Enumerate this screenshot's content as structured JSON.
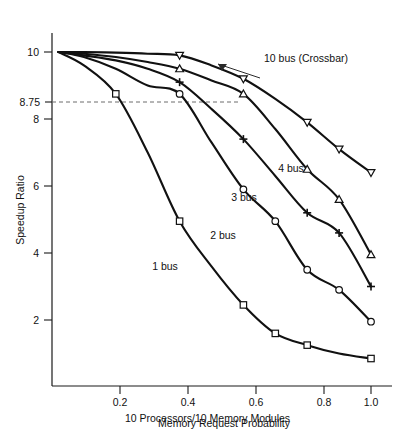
{
  "chart_data": {
    "type": "line",
    "title": "",
    "subtitle": "",
    "caption": "10 Processors/10 Memory Modules",
    "xlabel": "Memory Request Probability",
    "ylabel": "Speedup Ratio",
    "xlim": [
      0.0,
      1.08
    ],
    "ylim": [
      0.0,
      10.6
    ],
    "grid": false,
    "legend_position": "inline-annotations",
    "xticks": [
      0.2,
      0.4,
      0.6,
      0.8,
      1.0
    ],
    "xtick_labels": [
      "0.2",
      "0.4",
      "0.6",
      "0.8",
      "1.0"
    ],
    "yticks": [
      2,
      4,
      6,
      8,
      8.75,
      10
    ],
    "ytick_labels": [
      "2",
      "4",
      "6",
      "8",
      "8.75",
      "10"
    ],
    "annotations": [
      {
        "name": "crossbar-callout",
        "text": "10 bus (Crossbar)",
        "x": 0.6,
        "y": 9.95
      },
      {
        "name": "reference-line-8-75",
        "text": "8.75",
        "value": 8.75,
        "style": "dashed",
        "from_x": 0.0,
        "to_x": 0.62
      }
    ],
    "series": [
      {
        "name": "10 bus (Crossbar)",
        "label": "10 bus (Crossbar)",
        "marker": "triangle-down",
        "x": [
          0.02,
          0.1,
          0.2,
          0.3,
          0.4,
          0.5,
          0.6,
          0.7,
          0.8,
          0.9,
          1.0
        ],
        "values": [
          10.0,
          10.0,
          9.98,
          9.95,
          9.9,
          9.6,
          9.2,
          8.6,
          7.9,
          7.1,
          6.4
        ]
      },
      {
        "name": "4 bus",
        "label": "4 bus",
        "marker": "triangle-up",
        "x": [
          0.02,
          0.1,
          0.2,
          0.3,
          0.4,
          0.5,
          0.6,
          0.7,
          0.8,
          0.9,
          1.0
        ],
        "values": [
          10.0,
          9.95,
          9.85,
          9.7,
          9.5,
          9.15,
          8.75,
          7.7,
          6.5,
          5.6,
          3.95
        ]
      },
      {
        "name": "3 bus",
        "label": "3 bus",
        "marker": "plus",
        "x": [
          0.02,
          0.1,
          0.2,
          0.3,
          0.4,
          0.5,
          0.6,
          0.7,
          0.8,
          0.9,
          1.0
        ],
        "values": [
          10.0,
          9.9,
          9.75,
          9.5,
          9.1,
          8.3,
          7.4,
          6.3,
          5.2,
          4.6,
          3.0
        ]
      },
      {
        "name": "2 bus",
        "label": "2 bus",
        "marker": "circle",
        "x": [
          0.02,
          0.1,
          0.2,
          0.3,
          0.4,
          0.5,
          0.6,
          0.7,
          0.8,
          0.9,
          1.0
        ],
        "values": [
          10.0,
          9.85,
          9.5,
          9.0,
          8.75,
          7.3,
          5.9,
          4.95,
          3.5,
          2.9,
          1.95
        ]
      },
      {
        "name": "1 bus",
        "label": "1 bus",
        "marker": "square",
        "x": [
          0.02,
          0.1,
          0.2,
          0.3,
          0.4,
          0.5,
          0.6,
          0.7,
          0.8,
          0.9,
          1.0
        ],
        "values": [
          10.0,
          9.6,
          8.75,
          7.0,
          4.95,
          3.6,
          2.45,
          1.6,
          1.25,
          1.0,
          0.85
        ]
      }
    ],
    "marked_points": [
      {
        "series": "1 bus",
        "x": 0.2,
        "y": 8.75,
        "marker": "square"
      },
      {
        "series": "1 bus",
        "x": 0.4,
        "y": 4.95,
        "marker": "square"
      },
      {
        "series": "1 bus",
        "x": 0.6,
        "y": 2.45,
        "marker": "square"
      },
      {
        "series": "1 bus",
        "x": 0.7,
        "y": 1.6,
        "marker": "square"
      },
      {
        "series": "1 bus",
        "x": 0.8,
        "y": 1.25,
        "marker": "square"
      },
      {
        "series": "1 bus",
        "x": 1.0,
        "y": 0.85,
        "marker": "square"
      },
      {
        "series": "2 bus",
        "x": 0.4,
        "y": 8.75,
        "marker": "circle"
      },
      {
        "series": "2 bus",
        "x": 0.6,
        "y": 5.9,
        "marker": "circle"
      },
      {
        "series": "2 bus",
        "x": 0.7,
        "y": 4.95,
        "marker": "circle"
      },
      {
        "series": "2 bus",
        "x": 0.8,
        "y": 3.5,
        "marker": "circle"
      },
      {
        "series": "2 bus",
        "x": 0.9,
        "y": 2.9,
        "marker": "circle"
      },
      {
        "series": "2 bus",
        "x": 1.0,
        "y": 1.95,
        "marker": "circle"
      },
      {
        "series": "3 bus",
        "x": 0.4,
        "y": 9.1,
        "marker": "plus"
      },
      {
        "series": "3 bus",
        "x": 0.6,
        "y": 7.4,
        "marker": "plus"
      },
      {
        "series": "3 bus",
        "x": 0.8,
        "y": 5.2,
        "marker": "plus"
      },
      {
        "series": "3 bus",
        "x": 0.9,
        "y": 4.6,
        "marker": "plus"
      },
      {
        "series": "3 bus",
        "x": 1.0,
        "y": 3.0,
        "marker": "plus"
      },
      {
        "series": "4 bus",
        "x": 0.4,
        "y": 9.5,
        "marker": "triangle-up"
      },
      {
        "series": "4 bus",
        "x": 0.6,
        "y": 8.75,
        "marker": "triangle-up"
      },
      {
        "series": "4 bus",
        "x": 0.8,
        "y": 6.5,
        "marker": "triangle-up"
      },
      {
        "series": "4 bus",
        "x": 0.9,
        "y": 5.6,
        "marker": "triangle-up"
      },
      {
        "series": "4 bus",
        "x": 1.0,
        "y": 3.95,
        "marker": "triangle-up"
      },
      {
        "series": "10 bus (Crossbar)",
        "x": 0.4,
        "y": 9.9,
        "marker": "triangle-down"
      },
      {
        "series": "10 bus (Crossbar)",
        "x": 0.6,
        "y": 9.2,
        "marker": "triangle-down"
      },
      {
        "series": "10 bus (Crossbar)",
        "x": 0.8,
        "y": 7.9,
        "marker": "triangle-down"
      },
      {
        "series": "10 bus (Crossbar)",
        "x": 0.9,
        "y": 7.1,
        "marker": "triangle-down"
      },
      {
        "series": "10 bus (Crossbar)",
        "x": 1.0,
        "y": 6.4,
        "marker": "triangle-down"
      }
    ]
  },
  "axes": {
    "y_title": "Speedup Ratio",
    "x_title": "Memory Request Probability",
    "y_tick_10": "10",
    "y_tick_875": "8.75",
    "y_tick_8": "8",
    "y_tick_6": "6",
    "y_tick_4": "4",
    "y_tick_2": "2",
    "x_tick_02": "0.2",
    "x_tick_04": "0.4",
    "x_tick_06": "0.6",
    "x_tick_08": "0.8",
    "x_tick_10": "1.0"
  },
  "labels": {
    "crossbar": "10 bus (Crossbar)",
    "four_bus": "4 bus",
    "three_bus": "3 bus",
    "two_bus": "2 bus",
    "one_bus": "1 bus"
  },
  "caption": {
    "text": "10 Processors/10 Memory Modules"
  }
}
